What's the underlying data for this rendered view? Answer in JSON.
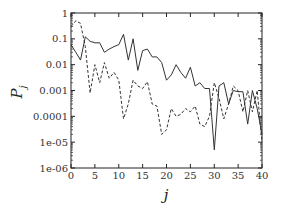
{
  "chart_data": {
    "type": "line",
    "title": "",
    "xlabel": "j",
    "ylabel": "P",
    "ylabel_subscript": "j",
    "xlim": [
      0,
      40
    ],
    "ylim": [
      1e-06,
      1
    ],
    "yscale": "log",
    "grid": false,
    "legend": null,
    "x_ticks": [
      0,
      5,
      10,
      15,
      20,
      25,
      30,
      35,
      40
    ],
    "x_tick_labels": [
      "0",
      "5",
      "10",
      "15",
      "20",
      "25",
      "30",
      "35",
      "40"
    ],
    "y_ticks": [
      1,
      0.1,
      0.01,
      0.001,
      0.0001,
      1e-05,
      1e-06
    ],
    "y_tick_labels": [
      "1",
      "0.1",
      "0.01",
      "0.001",
      "0.0001",
      "1e-05",
      "1e-06"
    ],
    "x": [
      0,
      1,
      2,
      3,
      4,
      5,
      6,
      7,
      8,
      9,
      10,
      11,
      12,
      13,
      14,
      15,
      16,
      17,
      18,
      19,
      20,
      21,
      22,
      23,
      24,
      25,
      26,
      27,
      28,
      29,
      30,
      31,
      32,
      33,
      34,
      35,
      36,
      37,
      38,
      39,
      40
    ],
    "series": [
      {
        "name": "solid",
        "style": "solid",
        "values": [
          0.06,
          0.03,
          0.015,
          0.12,
          0.08,
          0.07,
          0.07,
          0.03,
          0.04,
          0.05,
          0.06,
          0.15,
          0.015,
          0.1,
          0.006,
          0.035,
          0.04,
          0.02,
          0.02,
          0.012,
          0.0025,
          0.004,
          0.01,
          0.005,
          0.003,
          0.008,
          0.0015,
          0.002,
          0.0012,
          0.0012,
          5e-06,
          0.0015,
          0.002,
          0.0003,
          0.001,
          0.0009,
          0.0009,
          5e-05,
          0.001,
          0.0002,
          2e-05
        ]
      },
      {
        "name": "dashed",
        "style": "dashed",
        "values": [
          0.3,
          0.5,
          0.4,
          0.05,
          0.0008,
          0.01,
          0.002,
          0.012,
          0.003,
          0.005,
          0.0025,
          8e-05,
          0.0003,
          0.0025,
          0.0015,
          0.0012,
          0.0022,
          0.0003,
          0.00025,
          2e-05,
          3e-05,
          0.0002,
          0.0001,
          0.00012,
          0.0002,
          0.00015,
          0.00025,
          5e-05,
          4e-05,
          0.0001,
          0.002,
          0.0005,
          8e-05,
          0.0003,
          0.0015,
          0.001,
          0.00015,
          0.001,
          0.00015,
          0.001,
          1e-05
        ]
      }
    ]
  }
}
